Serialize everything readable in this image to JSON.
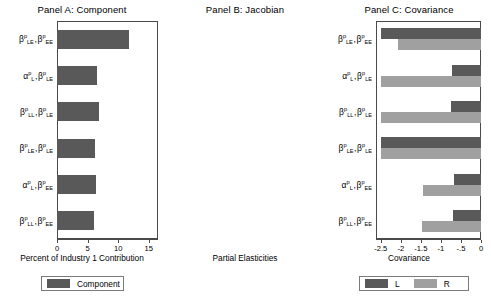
{
  "figure": {
    "categories_plain": [
      "b^p_LE , b^p_EE",
      "a^p_L , b^p_LE",
      "b^p_LL , b^p_LE",
      "b^p_LE , b^p_LE",
      "a^p_L , b^p_EE",
      "b^p_LL , b^p_EE"
    ]
  },
  "panel_a": {
    "title": "Panel A: Component",
    "xlabel": "Percent of Industry 1 Contribution",
    "ticks": [
      "0",
      "5",
      "10",
      "15"
    ],
    "legend": [
      {
        "label": "Component",
        "color": "#595959"
      }
    ]
  },
  "panel_b": {
    "title": "Panel B: Jacobian",
    "xlabel": "Partial Elasticities",
    "ticks": [
      "-2.5",
      "-2",
      "-1.5",
      "-1",
      "-.5",
      "0"
    ],
    "legend": [
      {
        "label": "L",
        "color": "#595959"
      },
      {
        "label": "R",
        "color": "#a0a0a0"
      }
    ]
  },
  "panel_c": {
    "title": "Panel C: Covariance",
    "xlabel": "Covariance",
    "ticks": [
      "0",
      ".0005"
    ],
    "legend": [
      {
        "label": "Covariance",
        "color": "#595959"
      }
    ]
  },
  "chart_data": [
    {
      "type": "bar",
      "title": "Panel A: Component",
      "orientation": "horizontal",
      "xlabel": "Percent of Industry 1 Contribution",
      "ylabel": "",
      "xlim": [
        0,
        16.5
      ],
      "xticks": [
        0,
        5,
        10,
        15
      ],
      "grid": false,
      "legend": [
        "Component"
      ],
      "legend_position": "below",
      "categories": [
        "β^p_LE , β^p_EE",
        "α^p_L , β^p_LE",
        "β^p_LL , β^p_LE",
        "β^p_LE , β^p_LE",
        "α^p_L , β^p_EE",
        "β^p_LL , β^p_EE"
      ],
      "series": [
        {
          "name": "Component",
          "color": "#595959",
          "values": [
            11.7,
            6.6,
            6.8,
            6.2,
            6.4,
            6.0
          ]
        }
      ]
    },
    {
      "type": "bar",
      "title": "Panel B: Jacobian",
      "orientation": "horizontal",
      "xlabel": "Partial Elasticities",
      "ylabel": "",
      "xlim": [
        -2.62,
        0
      ],
      "xticks": [
        -2.5,
        -2,
        -1.5,
        -1,
        -0.5,
        0
      ],
      "grid": false,
      "legend": [
        "L",
        "R"
      ],
      "legend_position": "below",
      "categories": [
        "β^p_LE , β^p_EE",
        "α^p_L , β^p_LE",
        "β^p_LL , β^p_LE",
        "β^p_LE , β^p_LE",
        "α^p_L , β^p_EE",
        "β^p_LL , β^p_EE"
      ],
      "series": [
        {
          "name": "L",
          "color": "#595959",
          "values": [
            -2.5,
            -0.72,
            -0.74,
            -2.5,
            -0.68,
            -0.7
          ]
        },
        {
          "name": "R",
          "color": "#a0a0a0",
          "values": [
            -2.07,
            -2.5,
            -2.5,
            -2.5,
            -1.45,
            -1.48
          ]
        }
      ]
    },
    {
      "type": "bar",
      "title": "Panel C: Covariance",
      "orientation": "horizontal",
      "xlabel": "Covariance",
      "ylabel": "",
      "xlim": [
        0,
        0.00058
      ],
      "xticks": [
        0,
        0.0005
      ],
      "xticklabels": [
        "0",
        ".0005"
      ],
      "grid": false,
      "legend": [
        "Covariance"
      ],
      "legend_position": "below",
      "categories": [
        "β^p_LE , β^p_EE",
        "α^p_L , β^p_LE",
        "β^p_LL , β^p_LE",
        "β^p_LE , β^p_LE",
        "α^p_L , β^p_EE",
        "β^p_LL , β^p_EE"
      ],
      "series": [
        {
          "name": "Covariance",
          "color": "#595959",
          "values": [
            0.00041,
            0.00042,
            0.00042,
            9.5e-05,
            0.00052,
            0.00052
          ]
        }
      ]
    }
  ]
}
